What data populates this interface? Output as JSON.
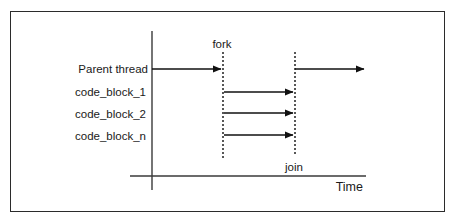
{
  "figure": {
    "border_color": "#2b2b2b",
    "background": "#ffffff",
    "line_color": "#111111"
  },
  "rows": [
    {
      "label": "Parent thread"
    },
    {
      "label": "code_block_1"
    },
    {
      "label": "code_block_2"
    },
    {
      "label": "code_block_n"
    }
  ],
  "markers": {
    "fork": "fork",
    "join": "join"
  },
  "axes": {
    "x_label": "Time"
  }
}
